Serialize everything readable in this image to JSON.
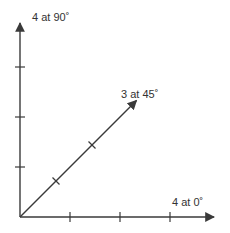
{
  "diagram": {
    "title": "",
    "line_color": "#3a3a3a",
    "text_color": "#333333",
    "vectors": [
      {
        "name": "x-axis-vector",
        "magnitude": 4,
        "angle_deg": 0,
        "label": "4 at 0˚"
      },
      {
        "name": "y-axis-vector",
        "magnitude": 4,
        "angle_deg": 90,
        "label": "4 at 90˚"
      },
      {
        "name": "diagonal-vector",
        "magnitude": 3,
        "angle_deg": 45,
        "label": "3 at 45˚"
      }
    ]
  }
}
